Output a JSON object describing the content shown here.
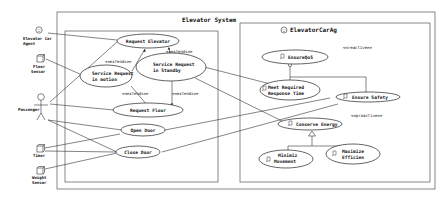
{
  "diagram": {
    "type": "uml-use-case",
    "outer_frame_title": "Elevator System",
    "agent_frame_title": "ElevatorCarAg",
    "actors": [
      {
        "id": "elevator-car-agent",
        "label_line1": "Elevator Car",
        "label_line2": "Agent",
        "icon": "smiley-agent-icon"
      },
      {
        "id": "floor-sensor",
        "label_line1": "Floor",
        "label_line2": "Sensor",
        "icon": "cube-sensor-icon"
      },
      {
        "id": "passenger",
        "label_line1": "Passenger",
        "label_line2": "",
        "icon": "stick-figure-icon"
      },
      {
        "id": "timer",
        "label_line1": "Timer",
        "label_line2": "",
        "icon": "cube-sensor-icon"
      },
      {
        "id": "weight-sensor",
        "label_line1": "Weight",
        "label_line2": "Sensor",
        "icon": "cube-sensor-icon"
      }
    ],
    "use_cases": [
      {
        "id": "request-elevator",
        "label_line1": "Request Elevator",
        "label_line2": ""
      },
      {
        "id": "service-request-motion",
        "label_line1": "Service Request",
        "label_line2": "in motion"
      },
      {
        "id": "service-request-standby",
        "label_line1": "Service Request",
        "label_line2": "in Standby"
      },
      {
        "id": "request-floor",
        "label_line1": "Request Floor",
        "label_line2": ""
      },
      {
        "id": "open-door",
        "label_line1": "Open Door",
        "label_line2": ""
      },
      {
        "id": "close-door",
        "label_line1": "Close Door",
        "label_line2": ""
      }
    ],
    "relations": {
      "extends": [
        "<<extends>>",
        "<<extends>>",
        "<<extends>>",
        "<<extends>>"
      ]
    },
    "goals": [
      {
        "id": "ensure-qos",
        "label_line1": "EnsureQoS",
        "label_line2": "",
        "stereotype": "<<reactive>>"
      },
      {
        "id": "meet-response-time",
        "label_line1": "Meet   Required",
        "label_line2": "Response Time"
      },
      {
        "id": "ensure-safety",
        "label_line1": "Ensure Safety",
        "label_line2": ""
      },
      {
        "id": "conserve-energy",
        "label_line1": "Conserve Energy",
        "label_line2": "",
        "stereotype": "<<proactive>>"
      },
      {
        "id": "minimize-movement",
        "label_line1": "Minimiz",
        "label_line2": "Movement"
      },
      {
        "id": "maximize-efficiency",
        "label_line1": "Maximize",
        "label_line2": "Efficien"
      }
    ]
  }
}
